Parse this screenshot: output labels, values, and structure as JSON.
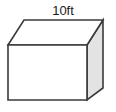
{
  "figure": {
    "name": "cube-diagram",
    "shape_type": "cube",
    "labels": {
      "top_edge": "10ft"
    },
    "colors": {
      "outline": "#3a3a3a",
      "front_face": "#ffffff",
      "top_face": "#ffffff",
      "right_face": "#e3e3e3",
      "background": "#ffffff",
      "label_text": "#1a1a1a"
    },
    "geometry": {
      "front_top_left": [
        8,
        45
      ],
      "front_top_right": [
        87,
        45
      ],
      "front_bottom_right": [
        87,
        100
      ],
      "front_bottom_left": [
        8,
        100
      ],
      "back_top_left": [
        24,
        20
      ],
      "back_top_right": [
        103,
        20
      ],
      "back_bottom_right": [
        103,
        88
      ],
      "stroke_width": 1.6
    },
    "label_position": {
      "x": 63,
      "y": 15
    }
  }
}
